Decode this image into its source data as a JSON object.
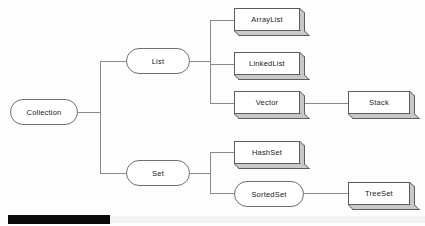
{
  "diagram": {
    "background_color": "#fdfdfd",
    "line_color": "#8a8a8a",
    "node_border_color": "#5c5c5c",
    "node_fill_color": "#ffffff",
    "shadow_color": "#c9c9c9",
    "text_color": "#1a1a1a"
  },
  "nodes": {
    "collection": {
      "label": "Collection",
      "shape": "rounded",
      "x": 10,
      "y": 99,
      "w": 68,
      "h": 26
    },
    "list": {
      "label": "List",
      "shape": "rounded",
      "x": 126,
      "y": 48,
      "w": 64,
      "h": 26
    },
    "set": {
      "label": "Set",
      "shape": "rounded",
      "x": 126,
      "y": 160,
      "w": 64,
      "h": 26
    },
    "sortedset": {
      "label": "SortedSet",
      "shape": "rounded",
      "x": 234,
      "y": 181,
      "w": 70,
      "h": 26
    },
    "arraylist": {
      "label": "ArrayList",
      "shape": "box3d",
      "x": 234,
      "y": 8,
      "w": 71,
      "h": 28
    },
    "linkedlist": {
      "label": "LinkedList",
      "shape": "box3d",
      "x": 234,
      "y": 52,
      "w": 71,
      "h": 28
    },
    "vector": {
      "label": "Vector",
      "shape": "box3d",
      "x": 234,
      "y": 91,
      "w": 71,
      "h": 28
    },
    "hashset": {
      "label": "HashSet",
      "shape": "box3d",
      "x": 234,
      "y": 141,
      "w": 71,
      "h": 28
    },
    "stack": {
      "label": "Stack",
      "shape": "box3d",
      "x": 348,
      "y": 91,
      "w": 67,
      "h": 28
    },
    "treeset": {
      "label": "TreeSet",
      "shape": "box3d",
      "x": 348,
      "y": 182,
      "w": 67,
      "h": 28
    }
  },
  "edges": [
    {
      "name": "collection-to-trunk",
      "from": "collection",
      "to": "trunk",
      "points": "78,112 100,112"
    },
    {
      "name": "trunk-vertical",
      "from": "trunk",
      "to": "trunk",
      "points": "100,61 100,173"
    },
    {
      "name": "trunk-to-list",
      "from": "trunk",
      "to": "list",
      "points": "100,61 126,61"
    },
    {
      "name": "trunk-to-set",
      "from": "trunk",
      "to": "set",
      "points": "100,173 126,173"
    },
    {
      "name": "list-to-branch",
      "from": "list",
      "to": "list-branch",
      "points": "190,61 210,61"
    },
    {
      "name": "list-branch-vertical",
      "from": "list-branch",
      "to": "list-branch",
      "points": "210,20 210,103"
    },
    {
      "name": "branch-to-arraylist",
      "from": "list-branch",
      "to": "arraylist",
      "points": "210,20 234,20"
    },
    {
      "name": "branch-to-linkedlist",
      "from": "list-branch",
      "to": "linkedlist",
      "points": "210,64 234,64"
    },
    {
      "name": "branch-to-vector",
      "from": "list-branch",
      "to": "vector",
      "points": "210,103 234,103"
    },
    {
      "name": "vector-to-stack",
      "from": "vector",
      "to": "stack",
      "points": "305,103 348,103"
    },
    {
      "name": "set-to-branch",
      "from": "set",
      "to": "set-branch",
      "points": "190,173 210,173"
    },
    {
      "name": "set-branch-vertical",
      "from": "set-branch",
      "to": "set-branch",
      "points": "210,152 210,193"
    },
    {
      "name": "branch-to-hashset",
      "from": "set-branch",
      "to": "hashset",
      "points": "210,152 234,152"
    },
    {
      "name": "branch-to-sortedset",
      "from": "set-branch",
      "to": "sortedset",
      "points": "210,193 234,193"
    },
    {
      "name": "sortedset-to-treeset",
      "from": "sortedset",
      "to": "treeset",
      "points": "304,193 348,193"
    }
  ],
  "footer": {
    "progress_bar": {
      "label": "",
      "x": 8,
      "y": 215,
      "w": 102,
      "h": 9,
      "color": "#0a0a0a"
    },
    "track": {
      "x": 8,
      "y": 216,
      "w": 417,
      "h": 7,
      "color": "#f2f2f2"
    }
  }
}
